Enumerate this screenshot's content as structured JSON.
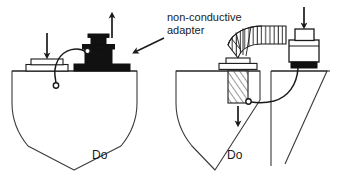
{
  "figure": {
    "type": "technical-line-diagram",
    "background_color": "#ffffff",
    "line_color": "#1a1a1a",
    "fill_dark": "#111111",
    "width": 338,
    "height": 180
  },
  "annotations": {
    "adapter_label_line1": "non-conductive",
    "adapter_label_line2": "adapter",
    "caption_left": "Do",
    "caption_right": "Do"
  },
  "panels": [
    {
      "id": "left-panel",
      "name": "left-vessel-assembly",
      "caption": "Do",
      "vessel": {
        "name": "v-bottom-tank",
        "shape": "v-bottom"
      },
      "components": [
        {
          "name": "flat-flange-plate",
          "position": "left-of-deck"
        },
        {
          "name": "down-arrow-over-flange",
          "direction": "down"
        },
        {
          "name": "dark-stepped-adapter-fitting",
          "color": "#111111"
        },
        {
          "name": "up-arrow-over-adapter",
          "direction": "up"
        },
        {
          "name": "bonding-wire",
          "shape": "curved"
        },
        {
          "name": "wire-terminal-ring-upper"
        },
        {
          "name": "wire-terminal-ring-lower"
        }
      ]
    },
    {
      "id": "right-panel",
      "name": "right-vessel-assembly",
      "caption": "Do",
      "vessel": {
        "name": "v-bottom-tank",
        "shape": "v-bottom"
      },
      "components": [
        {
          "name": "corrugated-hose",
          "orientation": "horizontal-to-vertical-elbow"
        },
        {
          "name": "hose-flange-collar"
        },
        {
          "name": "threaded-screw-shaft",
          "hatch": "diagonal"
        },
        {
          "name": "down-arrow-under-screw",
          "direction": "down"
        },
        {
          "name": "cylindrical-nozzle-fitting"
        },
        {
          "name": "down-arrow-over-nozzle",
          "direction": "down"
        },
        {
          "name": "dark-gasket",
          "color": "#111111"
        },
        {
          "name": "bonding-wire",
          "shape": "curved"
        },
        {
          "name": "wire-terminal-ring"
        }
      ]
    }
  ]
}
